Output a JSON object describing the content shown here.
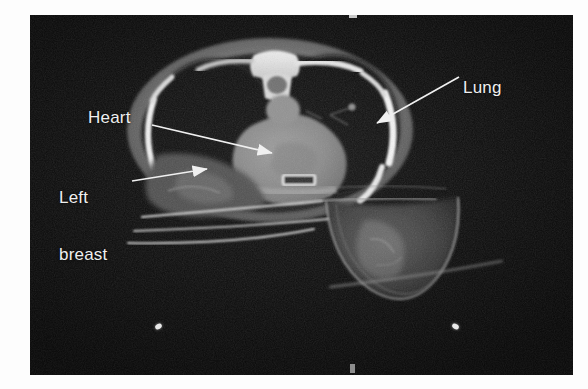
{
  "figure": {
    "type": "ct-scan-axial-chest",
    "caption_visible": false,
    "background_color": "#fdfdfd",
    "panel_color": "#0b0b0b"
  },
  "scan": {
    "modality": "CT",
    "plane": "axial",
    "body_region": "chest",
    "patient_position": "prone",
    "accent_color": "#efefef"
  },
  "annotations": [
    {
      "id": "heart",
      "label": "Heart",
      "label_lines": [
        "Heart"
      ],
      "text_x": 88,
      "text_y": 108,
      "arrow_from_x": 152,
      "arrow_from_y": 125,
      "arrow_to_x": 272,
      "arrow_to_y": 153
    },
    {
      "id": "left-breast",
      "label": "Left breast",
      "label_lines": [
        "Left",
        "breast"
      ],
      "text_x": 59,
      "text_y": 150,
      "arrow_from_x": 132,
      "arrow_from_y": 181,
      "arrow_to_x": 207,
      "arrow_to_y": 169
    },
    {
      "id": "lung",
      "label": "Lung",
      "label_lines": [
        "Lung"
      ],
      "text_x": 463,
      "text_y": 78,
      "arrow_from_x": 459,
      "arrow_from_y": 77,
      "arrow_to_x": 377,
      "arrow_to_y": 123
    }
  ],
  "anatomy_structures": [
    {
      "name": "thoracic-cavity",
      "description": "chest wall outline"
    },
    {
      "name": "left-lung",
      "description": "dark air-filled lung field"
    },
    {
      "name": "right-lung",
      "description": "dark air-filled lung field"
    },
    {
      "name": "heart",
      "description": "central grey soft-tissue mass"
    },
    {
      "name": "vertebral-body",
      "description": "bright bone at top centre"
    },
    {
      "name": "spinal-canal",
      "description": "dark canal within vertebra"
    },
    {
      "name": "ribs",
      "description": "bright curved cortical bone"
    },
    {
      "name": "sternum",
      "description": "bright bar anterior midline"
    },
    {
      "name": "pendulous-breast",
      "description": "breast hanging through aperture"
    },
    {
      "name": "couch-board",
      "description": "thin bright prone board lines"
    }
  ],
  "markers": {
    "fiducials": [
      {
        "name": "fiducial-left",
        "x": 158,
        "y": 327
      },
      {
        "name": "fiducial-right",
        "x": 455,
        "y": 327
      }
    ],
    "edge_ticks": [
      {
        "name": "tick-top",
        "x": 350,
        "y": 15,
        "w": 7,
        "h": 3
      },
      {
        "name": "tick-bottom",
        "x": 350,
        "y": 365,
        "w": 5,
        "h": 9
      }
    ]
  }
}
